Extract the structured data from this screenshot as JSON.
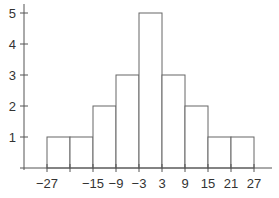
{
  "chart_data": {
    "type": "bar",
    "subtype": "histogram",
    "title": "",
    "xlabel": "",
    "ylabel": "",
    "bin_edges": [
      -27,
      -21,
      -15,
      -9,
      -3,
      3,
      9,
      15,
      21,
      27
    ],
    "categories": [
      "-27 to -21",
      "-21 to -15",
      "-15 to -9",
      "-9 to -3",
      "-3 to 3",
      "3 to 9",
      "9 to 15",
      "15 to 21",
      "21 to 27"
    ],
    "values": [
      1,
      1,
      2,
      3,
      5,
      3,
      2,
      1,
      1
    ],
    "x_tick_labels": [
      "−27",
      "−15",
      "−9",
      "−3",
      "3",
      "9",
      "15",
      "21",
      "27"
    ],
    "x_tick_values": [
      -27,
      -15,
      -9,
      -3,
      3,
      9,
      15,
      21,
      27
    ],
    "y_tick_labels": [
      "1",
      "2",
      "3",
      "4",
      "5"
    ],
    "y_tick_values": [
      1,
      2,
      3,
      4,
      5
    ],
    "xlim": [
      -33,
      33
    ],
    "ylim": [
      0,
      5
    ],
    "grid": false,
    "legend": null,
    "colors": {
      "bar_fill": "#ffffff",
      "bar_stroke": "#666666",
      "axis": "#555555",
      "text": "#333333"
    }
  }
}
